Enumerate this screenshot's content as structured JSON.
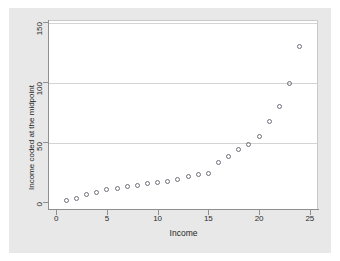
{
  "chart_data": {
    "type": "scatter",
    "title": "",
    "xlabel": "Income",
    "ylabel": "Income coded at the midpoint",
    "xlim": [
      -0.8,
      25.8
    ],
    "ylim": [
      -6,
      152
    ],
    "xticks": [
      0,
      5,
      10,
      15,
      20,
      25
    ],
    "xticklabels": [
      "0",
      "5",
      "10",
      "15",
      "20",
      "25"
    ],
    "yticks": [
      0,
      50,
      100,
      150
    ],
    "yticklabels": [
      "0",
      "50",
      "100",
      "150"
    ],
    "grid": "horizontal",
    "legend": "none",
    "marker": "open-circle",
    "marker_color": "#6e6e7a",
    "background_color": "#e8e8e8",
    "plot_background_color": "#ffffff",
    "gridline_color": "#d4d4d4",
    "axis_color": "#8f8f8f",
    "x": [
      1,
      2,
      3,
      4,
      5,
      6,
      7,
      8,
      9,
      10,
      11,
      12,
      13,
      14,
      15,
      16,
      17,
      18,
      19,
      20,
      21,
      22,
      23,
      24
    ],
    "y": [
      1,
      3,
      6,
      8,
      10,
      11,
      13,
      14,
      15,
      16,
      17,
      19,
      21,
      23,
      24,
      33,
      38,
      44,
      48,
      55,
      67,
      80,
      99,
      130
    ],
    "n_points": 24
  }
}
